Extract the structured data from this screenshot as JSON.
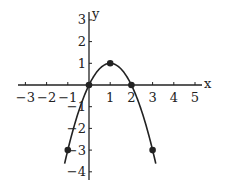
{
  "chart_data": {
    "type": "line",
    "title": "",
    "xlabel": "x",
    "ylabel": "y",
    "xlim": [
      -3.2,
      5.6
    ],
    "ylim": [
      -4.3,
      3.4
    ],
    "grid": false,
    "x_ticks": [
      -3,
      -2,
      -1,
      1,
      2,
      3,
      4,
      5
    ],
    "y_ticks": [
      -4,
      -3,
      -2,
      -1,
      1,
      2,
      3
    ],
    "x_tick_labels": [
      "−3",
      "−2",
      "−1",
      "1",
      "2",
      "3",
      "4",
      "5"
    ],
    "y_tick_labels": [
      "−4",
      "−3",
      "−2",
      "−1",
      "1",
      "2",
      "3"
    ],
    "curve": {
      "equation": "y = -x^2 + 2x",
      "x_range": [
        -1.15,
        3.15
      ]
    },
    "points": [
      {
        "x": -1,
        "y": -3
      },
      {
        "x": 0,
        "y": 0
      },
      {
        "x": 1,
        "y": 1
      },
      {
        "x": 2,
        "y": 0
      },
      {
        "x": 3,
        "y": -3
      }
    ],
    "colors": {
      "curve": "#222222",
      "axes": "#222222",
      "points": "#222222"
    }
  }
}
